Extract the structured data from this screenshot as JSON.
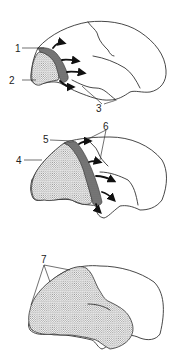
{
  "figure": {
    "panels": [
      {
        "id": "top",
        "labels": [
          {
            "text": "1",
            "target": "dark-band"
          },
          {
            "text": "2",
            "target": "dotted-region"
          },
          {
            "text": "3",
            "target": "sulci"
          }
        ]
      },
      {
        "id": "middle",
        "labels": [
          {
            "text": "5",
            "target": "dark-band"
          },
          {
            "text": "6",
            "target": "sulci"
          },
          {
            "text": "4",
            "target": "dotted-region"
          }
        ]
      },
      {
        "id": "bottom",
        "labels": [
          {
            "text": "7",
            "target": "dotted-region-boundary"
          }
        ]
      }
    ]
  },
  "colors": {
    "outline": "#333333",
    "dark_band": "#7a7a7a",
    "stipple": "#9a9a9a",
    "background": "#ffffff"
  }
}
